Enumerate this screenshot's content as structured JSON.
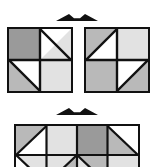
{
  "figure": {
    "colors": {
      "outline": "#111111",
      "white": "#ffffff",
      "light_gray": "#e2e2e2",
      "mid_gray": "#b9b9b9",
      "dark_gray": "#9a9a9a",
      "background": "#ffffff"
    },
    "arrows": [
      {
        "name": "top-double-arrow",
        "label": "↔",
        "direction": "double-horizontal",
        "x": 56,
        "y": 14,
        "width": 42,
        "height": 9
      },
      {
        "name": "bottom-double-arrow",
        "label": "↔",
        "direction": "double-horizontal",
        "x": 56,
        "y": 108,
        "width": 42,
        "height": 9
      }
    ],
    "groups": [
      {
        "name": "top-row",
        "shapes": [
          {
            "name": "square-left",
            "kind": "square",
            "x": 7,
            "y": 27,
            "width": 66,
            "height": 66,
            "rows": 2,
            "cols": 2,
            "cells": [
              {
                "row": 0,
                "col": 0,
                "pattern": "solid",
                "fill": "dark_gray",
                "second_fill": ""
              },
              {
                "row": 0,
                "col": 1,
                "pattern": "diag-tlbr",
                "fill": "white",
                "second_fill": "light_gray"
              },
              {
                "row": 1,
                "col": 0,
                "pattern": "diag-tlbr",
                "fill": "white",
                "second_fill": "mid_gray"
              },
              {
                "row": 1,
                "col": 1,
                "pattern": "solid",
                "fill": "light_gray",
                "second_fill": ""
              }
            ]
          },
          {
            "name": "square-right",
            "kind": "square",
            "x": 84,
            "y": 27,
            "width": 66,
            "height": 66,
            "rows": 2,
            "cols": 2,
            "cells": [
              {
                "row": 0,
                "col": 0,
                "pattern": "diag-trbl",
                "fill": "mid_gray",
                "second_fill": "white"
              },
              {
                "row": 0,
                "col": 1,
                "pattern": "solid",
                "fill": "light_gray",
                "second_fill": ""
              },
              {
                "row": 1,
                "col": 0,
                "pattern": "solid",
                "fill": "mid_gray",
                "second_fill": ""
              },
              {
                "row": 1,
                "col": 1,
                "pattern": "diag-trbl",
                "fill": "white",
                "second_fill": "mid_gray"
              }
            ]
          }
        ]
      },
      {
        "name": "bottom-row",
        "shapes": [
          {
            "name": "rectangle-strip",
            "kind": "rectangle",
            "x": 14,
            "y": 124,
            "width": 126,
            "height": 62,
            "rows": 2,
            "cols": 4,
            "clipped": true,
            "cells": [
              {
                "row": 0,
                "col": 0,
                "pattern": "diag-trbl",
                "fill": "mid_gray",
                "second_fill": "white"
              },
              {
                "row": 0,
                "col": 1,
                "pattern": "solid",
                "fill": "light_gray",
                "second_fill": ""
              },
              {
                "row": 0,
                "col": 2,
                "pattern": "solid",
                "fill": "dark_gray",
                "second_fill": ""
              },
              {
                "row": 0,
                "col": 3,
                "pattern": "diag-tlbr",
                "fill": "mid_gray",
                "second_fill": "white"
              },
              {
                "row": 1,
                "col": 0,
                "pattern": "diag-tlbr",
                "fill": "light_gray",
                "second_fill": "white"
              },
              {
                "row": 1,
                "col": 1,
                "pattern": "diag-trbl",
                "fill": "light_gray",
                "second_fill": "mid_gray"
              },
              {
                "row": 1,
                "col": 2,
                "pattern": "diag-tlbr",
                "fill": "mid_gray",
                "second_fill": "light_gray"
              },
              {
                "row": 1,
                "col": 3,
                "pattern": "solid",
                "fill": "light_gray",
                "second_fill": ""
              }
            ]
          }
        ]
      }
    ]
  }
}
